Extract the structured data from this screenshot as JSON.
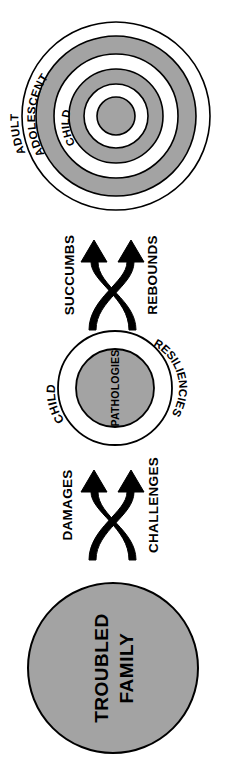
{
  "diagram": {
    "orientation": "rotated-90-clockwise",
    "colors": {
      "fill_gray": "#a3a3a3",
      "stroke_black": "#000000",
      "background_white": "#ffffff"
    },
    "nodes": {
      "outcome_circle": {
        "name": "Concentric Developmental Stages",
        "rings": [
          {
            "label": "ADULT",
            "fill": "#ffffff"
          },
          {
            "label": "ADOLESCENT",
            "fill": "#a3a3a3"
          },
          {
            "label": "CHILD",
            "fill": "#a3a3a3"
          }
        ],
        "ring_labels": [
          "ADULT",
          "ADOLESCENT",
          "CHILD"
        ]
      },
      "child_circle": {
        "name": "Child Node",
        "outer_label": "CHILD",
        "right_label": "RESILIENCIES",
        "inner_label": "PATHOLOGIES",
        "inner_fill": "#a3a3a3",
        "outer_fill": "#ffffff"
      },
      "family_circle": {
        "name": "Troubled Family Node",
        "label_line1": "TROUBLED",
        "label_line2": "FAMILY",
        "fill": "#a3a3a3"
      }
    },
    "connectors": {
      "upper": {
        "name": "succumbs-rebounds-arrows",
        "left_label": "SUCCUMBS",
        "right_label": "REBOUNDS"
      },
      "lower": {
        "name": "damages-challenges-arrows",
        "left_label": "DAMAGES",
        "right_label": "CHALLENGES"
      }
    }
  }
}
